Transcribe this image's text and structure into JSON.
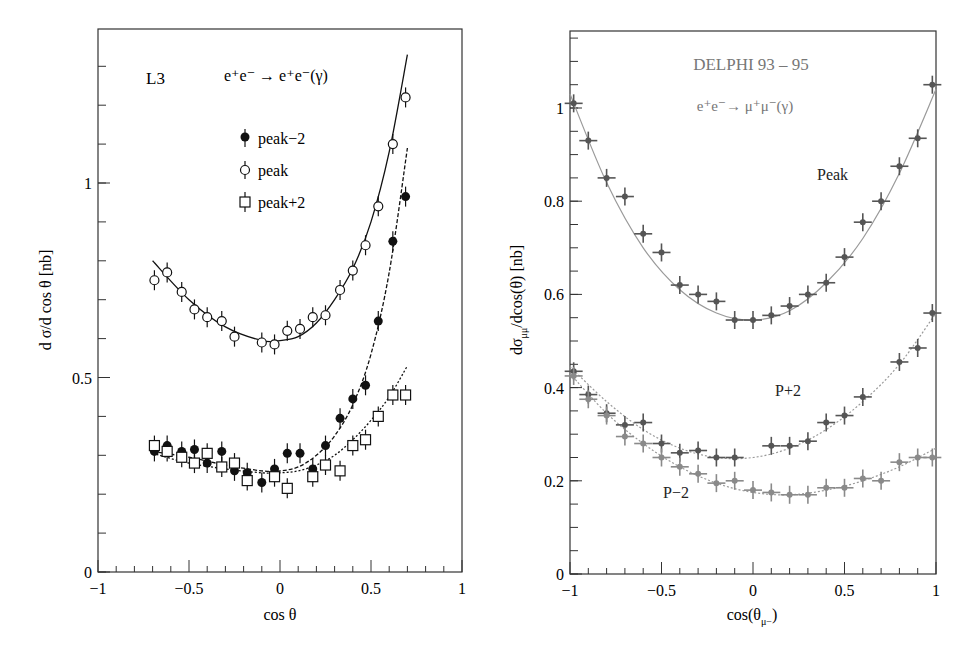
{
  "chart_data": [
    {
      "type": "scatter",
      "panel": "left",
      "experiment_label": "L3",
      "process_label": "e⁺e⁻ → e⁺e⁻(γ)",
      "xlabel": "cos θ",
      "ylabel": "d σ/d cos θ  [nb]",
      "xlim": [
        -1,
        1
      ],
      "ylim": [
        0,
        1.4
      ],
      "xticks": [
        -1,
        -0.5,
        0,
        0.5,
        1
      ],
      "xtick_labels": [
        "−1",
        "−0.5",
        "0",
        "0.5",
        "1"
      ],
      "yticks": [
        0,
        0.5,
        1
      ],
      "ytick_labels": [
        "0",
        "0.5",
        "1"
      ],
      "grid": false,
      "legend_position": "upper-center",
      "legend": [
        {
          "label": "peak−2",
          "marker": "filled-circle"
        },
        {
          "label": "peak",
          "marker": "open-circle"
        },
        {
          "label": "peak+2",
          "marker": "open-square"
        }
      ],
      "series": [
        {
          "name": "peak",
          "marker": "open-circle",
          "fit_line": "solid",
          "x": [
            -0.69,
            -0.62,
            -0.54,
            -0.47,
            -0.4,
            -0.32,
            -0.25,
            -0.1,
            -0.03,
            0.04,
            0.11,
            0.18,
            0.25,
            0.33,
            0.4,
            0.47,
            0.54,
            0.62,
            0.69
          ],
          "y": [
            0.75,
            0.77,
            0.72,
            0.675,
            0.655,
            0.645,
            0.605,
            0.59,
            0.585,
            0.62,
            0.625,
            0.655,
            0.66,
            0.725,
            0.775,
            0.84,
            0.94,
            1.1,
            1.22
          ],
          "fit": {
            "x": [
              -0.7,
              -0.5,
              -0.3,
              -0.1,
              0.0,
              0.1,
              0.2,
              0.3,
              0.4,
              0.5,
              0.6,
              0.7
            ],
            "y": [
              0.8,
              0.7,
              0.63,
              0.595,
              0.595,
              0.605,
              0.64,
              0.7,
              0.78,
              0.9,
              1.08,
              1.33
            ]
          }
        },
        {
          "name": "peak−2",
          "marker": "filled-circle",
          "fit_line": "dashed",
          "x": [
            -0.69,
            -0.62,
            -0.54,
            -0.47,
            -0.4,
            -0.32,
            -0.25,
            -0.18,
            -0.1,
            -0.03,
            0.04,
            0.11,
            0.18,
            0.25,
            0.33,
            0.4,
            0.47,
            0.54,
            0.62,
            0.69
          ],
          "y": [
            0.31,
            0.325,
            0.31,
            0.315,
            0.28,
            0.31,
            0.26,
            0.255,
            0.23,
            0.265,
            0.305,
            0.305,
            0.265,
            0.325,
            0.395,
            0.445,
            0.48,
            0.645,
            0.85,
            0.965
          ],
          "fit": {
            "x": [
              -0.7,
              -0.5,
              -0.3,
              -0.1,
              0.0,
              0.1,
              0.2,
              0.3,
              0.4,
              0.5,
              0.6,
              0.7
            ],
            "y": [
              0.31,
              0.295,
              0.275,
              0.26,
              0.26,
              0.27,
              0.3,
              0.35,
              0.43,
              0.56,
              0.77,
              1.09
            ]
          }
        },
        {
          "name": "peak+2",
          "marker": "open-square",
          "fit_line": "dotted",
          "x": [
            -0.69,
            -0.62,
            -0.54,
            -0.47,
            -0.4,
            -0.32,
            -0.25,
            -0.18,
            -0.03,
            0.04,
            0.18,
            0.25,
            0.33,
            0.4,
            0.47,
            0.54,
            0.62,
            0.69
          ],
          "y": [
            0.325,
            0.31,
            0.295,
            0.28,
            0.305,
            0.27,
            0.28,
            0.235,
            0.245,
            0.215,
            0.245,
            0.275,
            0.26,
            0.325,
            0.34,
            0.4,
            0.455,
            0.455
          ],
          "fit": {
            "x": [
              -0.7,
              -0.5,
              -0.3,
              -0.1,
              0.0,
              0.1,
              0.2,
              0.3,
              0.4,
              0.5,
              0.6,
              0.7
            ],
            "y": [
              0.305,
              0.28,
              0.265,
              0.255,
              0.255,
              0.26,
              0.275,
              0.3,
              0.34,
              0.39,
              0.45,
              0.53
            ]
          }
        }
      ]
    },
    {
      "type": "scatter",
      "panel": "right",
      "experiment_label": "DELPHI 93 – 95",
      "process_label": "e⁺e⁻→ μ⁺μ⁻(γ)",
      "xlabel": "cos(θ_μ−)",
      "ylabel": "dσ_μμ/dcos(θ) [nb]",
      "xlim": [
        -1,
        1
      ],
      "ylim": [
        0,
        1.15
      ],
      "xticks": [
        -1,
        -0.5,
        0,
        0.5,
        1
      ],
      "xtick_labels": [
        "−1",
        "−0.5",
        "0",
        "0.5",
        "1"
      ],
      "yticks": [
        0,
        0.2,
        0.4,
        0.6,
        0.8,
        1
      ],
      "ytick_labels": [
        "0",
        "0.2",
        "0.4",
        "0.6",
        "0.8",
        "1"
      ],
      "grid": false,
      "annotations": [
        "Peak",
        "P+2",
        "P−2"
      ],
      "series": [
        {
          "name": "Peak",
          "marker": "cross-errorbar-dark",
          "fit_line": "solid-gray",
          "x": [
            -0.98,
            -0.9,
            -0.8,
            -0.7,
            -0.6,
            -0.5,
            -0.4,
            -0.3,
            -0.2,
            -0.1,
            0.0,
            0.1,
            0.2,
            0.3,
            0.4,
            0.5,
            0.6,
            0.7,
            0.8,
            0.9,
            0.98
          ],
          "y": [
            1.01,
            0.93,
            0.85,
            0.81,
            0.73,
            0.69,
            0.62,
            0.6,
            0.585,
            0.545,
            0.545,
            0.555,
            0.575,
            0.6,
            0.625,
            0.68,
            0.755,
            0.8,
            0.875,
            0.935,
            1.05
          ],
          "fit": {
            "x": [
              -1,
              -0.8,
              -0.6,
              -0.4,
              -0.2,
              0.0,
              0.2,
              0.4,
              0.6,
              0.8,
              1
            ],
            "y": [
              1.03,
              0.84,
              0.7,
              0.61,
              0.56,
              0.545,
              0.565,
              0.625,
              0.72,
              0.86,
              1.04
            ]
          }
        },
        {
          "name": "P+2",
          "marker": "cross-errorbar-dark",
          "fit_line": "dotted-gray",
          "x": [
            -0.98,
            -0.9,
            -0.8,
            -0.7,
            -0.6,
            -0.5,
            -0.4,
            -0.3,
            -0.2,
            -0.1,
            0.1,
            0.2,
            0.3,
            0.4,
            0.5,
            0.6,
            0.8,
            0.9,
            0.98
          ],
          "y": [
            0.435,
            0.385,
            0.345,
            0.32,
            0.325,
            0.28,
            0.26,
            0.265,
            0.25,
            0.25,
            0.275,
            0.275,
            0.285,
            0.325,
            0.34,
            0.38,
            0.455,
            0.485,
            0.56
          ],
          "fit": {
            "x": [
              -1,
              -0.8,
              -0.6,
              -0.4,
              -0.2,
              0.0,
              0.2,
              0.4,
              0.6,
              0.8,
              1
            ],
            "y": [
              0.445,
              0.37,
              0.31,
              0.27,
              0.25,
              0.25,
              0.27,
              0.31,
              0.37,
              0.45,
              0.56
            ]
          }
        },
        {
          "name": "P−2",
          "marker": "cross-errorbar-light",
          "fit_line": "dotted-gray",
          "x": [
            -0.98,
            -0.9,
            -0.8,
            -0.7,
            -0.6,
            -0.5,
            -0.4,
            -0.3,
            -0.2,
            -0.1,
            0.0,
            0.1,
            0.2,
            0.3,
            0.4,
            0.5,
            0.6,
            0.7,
            0.8,
            0.9,
            0.98
          ],
          "y": [
            0.425,
            0.375,
            0.34,
            0.295,
            0.28,
            0.25,
            0.23,
            0.215,
            0.195,
            0.2,
            0.18,
            0.175,
            0.17,
            0.17,
            0.185,
            0.185,
            0.205,
            0.2,
            0.24,
            0.25,
            0.25
          ],
          "fit": {
            "x": [
              -1,
              -0.8,
              -0.6,
              -0.4,
              -0.2,
              0.0,
              0.2,
              0.4,
              0.6,
              0.8,
              1
            ],
            "y": [
              0.43,
              0.345,
              0.28,
              0.23,
              0.195,
              0.175,
              0.17,
              0.18,
              0.2,
              0.23,
              0.27
            ]
          }
        }
      ]
    }
  ],
  "left": {
    "experiment": "L3",
    "process": "e⁺e⁻ → e⁺e⁻(γ)",
    "legend": [
      "peak−2",
      "peak",
      "peak+2"
    ],
    "xlabel": "cos θ",
    "ylabel": "d σ/d cos θ  [nb]",
    "xticks": [
      "−1",
      "−0.5",
      "0",
      "0.5",
      "1"
    ],
    "yticks": [
      "0",
      "0.5",
      "1"
    ]
  },
  "right": {
    "experiment": "DELPHI 93 – 95",
    "process": "e⁺e⁻→ μ⁺μ⁻(γ)",
    "annot_peak": "Peak",
    "annot_p2": "P+2",
    "annot_m2": "P−2",
    "xlabel_main": "cos(θ",
    "xlabel_sub": "μ−",
    "xlabel_end": ")",
    "ylabel_main": "dσ",
    "ylabel_sub": "μμ",
    "ylabel_end": "/dcos(θ) [nb]",
    "xticks": [
      "−1",
      "−0.5",
      "0",
      "0.5",
      "1"
    ],
    "yticks": [
      "0",
      "0.2",
      "0.4",
      "0.6",
      "0.8",
      "1"
    ]
  },
  "colors": {
    "axis": "#333333",
    "left_markers": "#111111",
    "right_dark_marker": "#555555",
    "right_light_marker": "#8a8a8a",
    "right_fit": "#9a9a9a",
    "delphi_text": "#777777"
  }
}
